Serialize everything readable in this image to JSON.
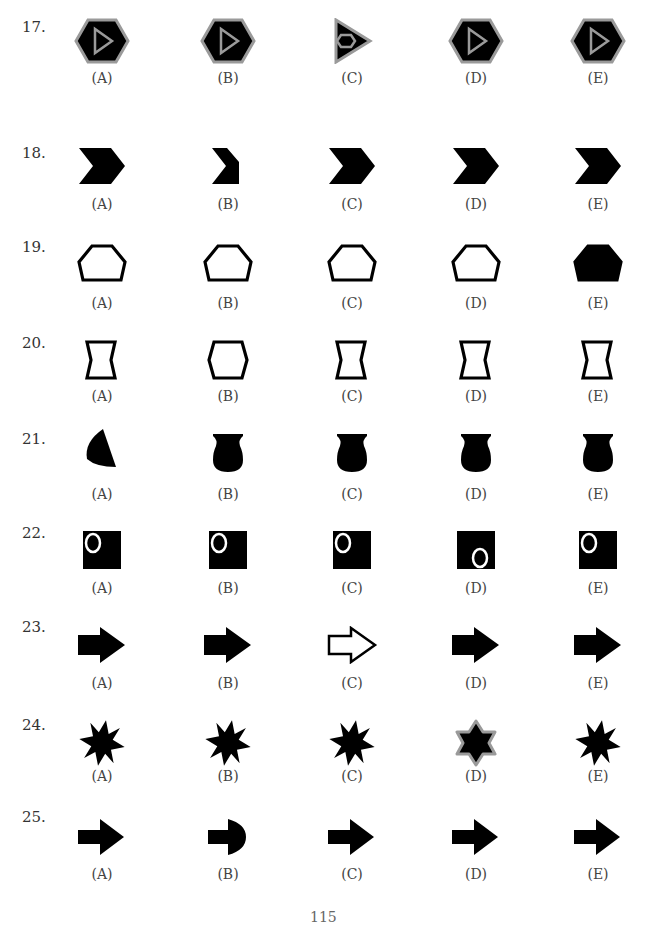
{
  "page": {
    "page_number": "115",
    "options": [
      "(A)",
      "(B)",
      "(C)",
      "(D)",
      "(E)"
    ],
    "colors": {
      "fill": "#000000",
      "outline_gray": "#9a9a9a",
      "text": "#333333"
    }
  },
  "questions": [
    {
      "number": "17.",
      "shapes": [
        "hexagon-with-triangle",
        "hexagon-with-triangle",
        "triangle-with-hexagon",
        "hexagon-with-triangle",
        "hexagon-with-triangle"
      ]
    },
    {
      "number": "18.",
      "shapes": [
        "chevron",
        "truncated-chevron",
        "chevron",
        "chevron",
        "chevron"
      ]
    },
    {
      "number": "19.",
      "shapes": [
        "pentagon-outline",
        "pentagon-outline",
        "pentagon-outline",
        "pentagon-outline",
        "pentagon-filled"
      ]
    },
    {
      "number": "20.",
      "shapes": [
        "hourglass-outline",
        "hexagon-outline",
        "hourglass-outline",
        "hourglass-outline",
        "hourglass-outline"
      ]
    },
    {
      "number": "21.",
      "shapes": [
        "wedge",
        "vase",
        "vase",
        "vase",
        "vase"
      ]
    },
    {
      "number": "22.",
      "shapes": [
        "square-circle-top-left",
        "square-circle-top-left",
        "square-circle-top-left",
        "square-circle-bottom-right",
        "square-circle-top-left"
      ]
    },
    {
      "number": "23.",
      "shapes": [
        "block-arrow-filled",
        "block-arrow-filled",
        "block-arrow-outline",
        "block-arrow-filled",
        "block-arrow-filled"
      ]
    },
    {
      "number": "24.",
      "shapes": [
        "eight-point-star",
        "eight-point-star",
        "eight-point-star",
        "six-point-star-gray-outline",
        "eight-point-star"
      ]
    },
    {
      "number": "25.",
      "shapes": [
        "arrow-right",
        "arrow-rounded-head",
        "arrow-right",
        "arrow-right",
        "arrow-right"
      ]
    }
  ]
}
